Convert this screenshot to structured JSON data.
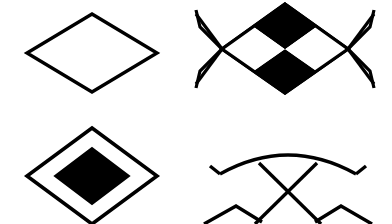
{
  "canvas": {
    "width": 392,
    "height": 224,
    "background_color": "#ffffff",
    "stroke_color": "#000000",
    "fill_color": "#000000",
    "stroke_width": 3.2,
    "description": "Four black-and-white geometric diamond glyph variations arranged in a two-by-two grid on a plain white background"
  },
  "glyphs": [
    {
      "id": "plain-diamond",
      "name": "Plain outlined diamond",
      "position": "top-left",
      "fill": "none",
      "stroke": "#000000",
      "cropped": false,
      "center": {
        "x": 92,
        "y": 53
      },
      "half_width": 65,
      "half_height": 39,
      "vertices": [
        {
          "x": 92,
          "y": 14
        },
        {
          "x": 157,
          "y": 53
        },
        {
          "x": 92,
          "y": 92
        },
        {
          "x": 27,
          "y": 53
        }
      ]
    },
    {
      "id": "checkered-diamond-with-whiskers",
      "name": "Checkerboard diamond with crossed side whiskers",
      "position": "top-right",
      "fill": "#000000",
      "stroke": "#000000",
      "cropped": true,
      "center": {
        "x": 285,
        "y": 49
      },
      "half_width": 63,
      "half_height": 45,
      "vertices": [
        {
          "x": 285,
          "y": 4
        },
        {
          "x": 348,
          "y": 49
        },
        {
          "x": 285,
          "y": 93
        },
        {
          "x": 222,
          "y": 49
        }
      ],
      "quadrants": [
        {
          "name": "top",
          "fill": "#000000"
        },
        {
          "name": "right",
          "fill": "#ffffff"
        },
        {
          "name": "bottom",
          "fill": "#000000"
        },
        {
          "name": "left",
          "fill": "#ffffff"
        }
      ],
      "whiskers": {
        "left_cross": {
          "x": 222,
          "y": 49
        },
        "right_cross": {
          "x": 348,
          "y": 49
        },
        "arm_length": 34,
        "count": 4
      }
    },
    {
      "id": "concentric-diamond",
      "name": "Outlined diamond enclosing a solid black diamond",
      "position": "bottom-left",
      "fill": "#000000",
      "stroke": "#000000",
      "cropped": true,
      "center": {
        "x": 92,
        "y": 176
      },
      "outer": {
        "half_width": 65,
        "half_height": 48,
        "vertices": [
          {
            "x": 92,
            "y": 128
          },
          {
            "x": 157,
            "y": 176
          },
          {
            "x": 92,
            "y": 224
          },
          {
            "x": 27,
            "y": 176
          }
        ]
      },
      "inner": {
        "fill": "#000000",
        "half_width": 37,
        "half_height": 28,
        "vertices": [
          {
            "x": 92,
            "y": 148
          },
          {
            "x": 129,
            "y": 176
          },
          {
            "x": 92,
            "y": 204
          },
          {
            "x": 55,
            "y": 176
          }
        ]
      }
    },
    {
      "id": "bowed-diamond-with-whiskers",
      "name": "Diamond with bowed arc edges and crossed whiskers",
      "position": "bottom-right",
      "fill": "none",
      "stroke": "#000000",
      "cropped": true,
      "center": {
        "x": 288,
        "y": 218
      },
      "half_width": 68,
      "half_height": 62,
      "arc": {
        "left_end": {
          "x": 220,
          "y": 174
        },
        "apex": {
          "x": 288,
          "y": 155
        },
        "right_end": {
          "x": 356,
          "y": 174
        },
        "bow": "convex-up"
      },
      "cross": {
        "center": {
          "x": 288,
          "y": 195
        },
        "top_left": {
          "x": 259,
          "y": 163
        },
        "top_right": {
          "x": 317,
          "y": 163
        },
        "bottom_left": {
          "x": 255,
          "y": 224
        },
        "bottom_right": {
          "x": 321,
          "y": 224
        }
      },
      "lower_notches": [
        {
          "apex": {
            "x": 236,
            "y": 206
          }
        },
        {
          "apex": {
            "x": 341,
            "y": 206
          }
        }
      ]
    }
  ],
  "layout": {
    "grid_rows": 2,
    "grid_columns": 2,
    "cell_width": 196,
    "cell_height": 112
  }
}
